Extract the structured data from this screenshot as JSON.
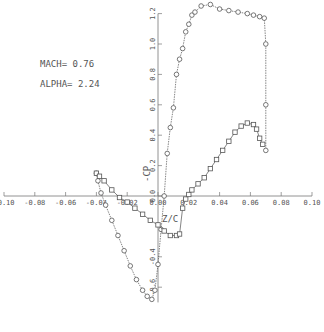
{
  "chart_data": {
    "type": "line",
    "title": "",
    "annotations": [
      "MACH= 0.76",
      "ALPHA= 2.24"
    ],
    "xlabel": "Z/C",
    "ylabel": "-CP",
    "xlim": [
      -0.1,
      0.1
    ],
    "ylim": [
      -0.7,
      1.25
    ],
    "grid": false,
    "legend": null,
    "x_ticks": [
      "-0.10",
      "-0.08",
      "-0.06",
      "-0.04",
      "-0.02",
      "0.00",
      "0.02",
      "0.04",
      "0.06",
      "0.08",
      "0.10"
    ],
    "y_ticks": [
      "-0.6",
      "-0.4",
      "0.0",
      "0.2",
      "0.4",
      "0.6",
      "0.8",
      "1.0",
      "1.2"
    ],
    "series": [
      {
        "name": "upper-surface-circles",
        "marker": "circle",
        "x": [
          -0.04,
          -0.039,
          -0.037,
          -0.034,
          -0.03,
          -0.026,
          -0.022,
          -0.018,
          -0.014,
          -0.01,
          -0.007,
          -0.004,
          -0.002,
          0.0,
          0.002,
          0.004,
          0.006,
          0.008,
          0.01,
          0.012,
          0.014,
          0.016,
          0.018,
          0.02,
          0.022,
          0.024,
          0.028,
          0.034,
          0.04,
          0.046,
          0.052,
          0.058,
          0.062,
          0.066,
          0.069,
          0.07,
          0.07,
          0.07
        ],
        "y": [
          0.15,
          0.1,
          0.02,
          -0.06,
          -0.16,
          -0.26,
          -0.36,
          -0.46,
          -0.55,
          -0.62,
          -0.66,
          -0.68,
          -0.62,
          -0.45,
          -0.22,
          0.0,
          0.28,
          0.45,
          0.58,
          0.8,
          0.9,
          0.97,
          1.08,
          1.13,
          1.19,
          1.21,
          1.25,
          1.26,
          1.23,
          1.22,
          1.21,
          1.2,
          1.19,
          1.18,
          1.17,
          1.0,
          0.6,
          0.3
        ]
      },
      {
        "name": "lower-surface-squares",
        "marker": "square",
        "x": [
          -0.04,
          -0.038,
          -0.035,
          -0.03,
          -0.025,
          -0.02,
          -0.015,
          -0.01,
          -0.005,
          0.0,
          0.004,
          0.008,
          0.012,
          0.014,
          0.016,
          0.018,
          0.02,
          0.022,
          0.026,
          0.03,
          0.034,
          0.038,
          0.042,
          0.046,
          0.05,
          0.054,
          0.058,
          0.062,
          0.064,
          0.066,
          0.068
        ],
        "y": [
          0.15,
          0.13,
          0.1,
          0.04,
          -0.01,
          -0.04,
          -0.08,
          -0.12,
          -0.16,
          -0.19,
          -0.23,
          -0.26,
          -0.26,
          -0.25,
          -0.08,
          -0.02,
          0.01,
          0.04,
          0.08,
          0.12,
          0.18,
          0.24,
          0.3,
          0.36,
          0.42,
          0.46,
          0.48,
          0.47,
          0.44,
          0.38,
          0.34
        ]
      }
    ]
  },
  "labels": {
    "mach": "MACH= 0.76",
    "alpha": "ALPHA= 2.24",
    "xlabel": "Z/C",
    "ylabel": "-CP"
  }
}
